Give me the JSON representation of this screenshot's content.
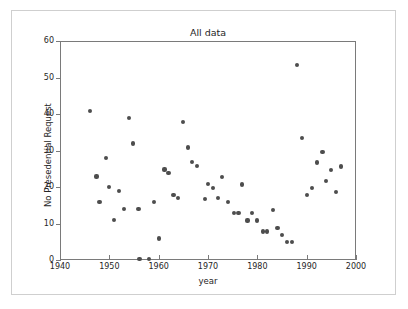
{
  "figure": {
    "background_color": "#ffffff",
    "border_color": "#cfcfcf",
    "axes_color": "#7a7a7a",
    "marker_color": "#4d4d4d"
  },
  "chart_data": {
    "type": "scatter",
    "title": "All data",
    "xlabel": "year",
    "ylabel": "No Presedential Request",
    "xlim": [
      1940,
      2000
    ],
    "ylim": [
      0,
      60
    ],
    "xticks": [
      1940,
      1950,
      1960,
      1970,
      1980,
      1990,
      2000
    ],
    "yticks": [
      0,
      10,
      20,
      30,
      40,
      50,
      60
    ],
    "xtick_labels": [
      "1940",
      "1950",
      "1960",
      "1970",
      "1980",
      "1990",
      "2000"
    ],
    "ytick_labels": [
      "0",
      "10",
      "20",
      "30",
      "40",
      "50",
      "60"
    ],
    "grid": false,
    "legend": null,
    "marker": "circle",
    "series": [
      {
        "name": "No Presedential Request",
        "points": [
          [
            1946.1,
            40.9
          ],
          [
            1947.4,
            22.9
          ],
          [
            1948.0,
            15.9
          ],
          [
            1949.3,
            27.9
          ],
          [
            1950.0,
            19.9
          ],
          [
            1951.0,
            11.0
          ],
          [
            1952.0,
            18.9
          ],
          [
            1953.0,
            13.9
          ],
          [
            1954.0,
            38.9
          ],
          [
            1954.8,
            31.9
          ],
          [
            1955.9,
            13.9
          ],
          [
            1956.1,
            0.2
          ],
          [
            1958.0,
            0.2
          ],
          [
            1959.0,
            15.9
          ],
          [
            1960.0,
            5.9
          ],
          [
            1961.2,
            24.8
          ],
          [
            1962.0,
            23.9
          ],
          [
            1963.0,
            17.9
          ],
          [
            1963.9,
            16.9
          ],
          [
            1965.0,
            37.9
          ],
          [
            1965.9,
            30.8
          ],
          [
            1966.8,
            26.9
          ],
          [
            1967.8,
            25.8
          ],
          [
            1969.4,
            16.8
          ],
          [
            1970.0,
            20.8
          ],
          [
            1971.0,
            19.8
          ],
          [
            1972.0,
            16.9
          ],
          [
            1972.9,
            22.8
          ],
          [
            1974.0,
            15.9
          ],
          [
            1975.3,
            12.8
          ],
          [
            1976.2,
            12.8
          ],
          [
            1976.9,
            20.7
          ],
          [
            1978.0,
            10.8
          ],
          [
            1979.0,
            12.8
          ],
          [
            1980.0,
            10.8
          ],
          [
            1981.1,
            7.8
          ],
          [
            1982.0,
            7.8
          ],
          [
            1983.1,
            13.8
          ],
          [
            1984.1,
            8.8
          ],
          [
            1985.0,
            6.8
          ],
          [
            1986.0,
            4.9
          ],
          [
            1987.0,
            4.9
          ],
          [
            1988.0,
            53.5
          ],
          [
            1989.0,
            33.5
          ],
          [
            1990.0,
            17.7
          ],
          [
            1991.0,
            19.7
          ],
          [
            1992.1,
            26.7
          ],
          [
            1993.2,
            29.6
          ],
          [
            1993.9,
            21.7
          ],
          [
            1994.9,
            24.6
          ],
          [
            1996.0,
            18.7
          ],
          [
            1997.0,
            25.6
          ]
        ]
      }
    ]
  }
}
